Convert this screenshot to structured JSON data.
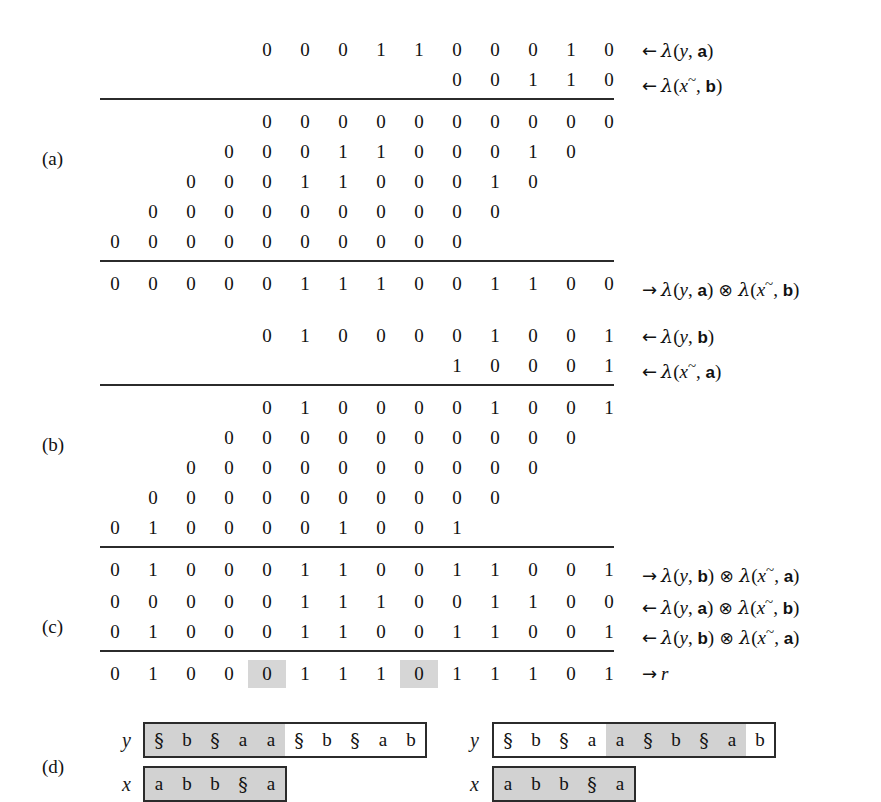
{
  "figure": {
    "caption_labels": [
      "(a)",
      "(b)",
      "(c)",
      "(d)"
    ],
    "columns": 14,
    "highlight_color": "#d6d6d6",
    "shade_color": "#d2d2d2",
    "rule_color": "#2b2b2b"
  },
  "section_a": {
    "label": "(a)",
    "operands": [
      {
        "digits": [
          "0",
          "0",
          "0",
          "1",
          "1",
          "0",
          "0",
          "0",
          "1",
          "0"
        ],
        "offset": 4,
        "label_arrow": "←",
        "label": "λ(y, a)",
        "label_parts": {
          "lambda": "λ",
          "open": "(",
          "var": "y",
          "comma": ", ",
          "sym": "a",
          "close": ")"
        }
      },
      {
        "digits": [
          "0",
          "0",
          "1",
          "1",
          "0"
        ],
        "offset": 9,
        "label_arrow": "←",
        "label": "λ(x~, b)",
        "label_parts": {
          "lambda": "λ",
          "open": "(",
          "var": "x",
          "tilde": "~",
          "comma": ", ",
          "sym": "b",
          "close": ")"
        }
      }
    ],
    "partials": [
      {
        "digits": [
          "0",
          "0",
          "0",
          "0",
          "0",
          "0",
          "0",
          "0",
          "0",
          "0"
        ],
        "offset": 4
      },
      {
        "digits": [
          "0",
          "0",
          "0",
          "1",
          "1",
          "0",
          "0",
          "0",
          "1",
          "0"
        ],
        "offset": 3
      },
      {
        "digits": [
          "0",
          "0",
          "0",
          "1",
          "1",
          "0",
          "0",
          "0",
          "1",
          "0"
        ],
        "offset": 2
      },
      {
        "digits": [
          "0",
          "0",
          "0",
          "0",
          "0",
          "0",
          "0",
          "0",
          "0",
          "0"
        ],
        "offset": 1
      },
      {
        "digits": [
          "0",
          "0",
          "0",
          "0",
          "0",
          "0",
          "0",
          "0",
          "0",
          "0"
        ],
        "offset": 0
      }
    ],
    "result": {
      "digits": [
        "0",
        "0",
        "0",
        "0",
        "0",
        "1",
        "1",
        "1",
        "0",
        "0",
        "1",
        "1",
        "0",
        "0"
      ],
      "offset": 0,
      "label_arrow": "→",
      "label": "λ(y, a) ⊗ λ(x~, b)"
    }
  },
  "section_b": {
    "label": "(b)",
    "operands": [
      {
        "digits": [
          "0",
          "1",
          "0",
          "0",
          "0",
          "0",
          "1",
          "0",
          "0",
          "1"
        ],
        "offset": 4,
        "label_arrow": "←",
        "label": "λ(y, b)"
      },
      {
        "digits": [
          "1",
          "0",
          "0",
          "0",
          "1"
        ],
        "offset": 9,
        "label_arrow": "←",
        "label": "λ(x~, a)"
      }
    ],
    "partials": [
      {
        "digits": [
          "0",
          "1",
          "0",
          "0",
          "0",
          "0",
          "1",
          "0",
          "0",
          "1"
        ],
        "offset": 4
      },
      {
        "digits": [
          "0",
          "0",
          "0",
          "0",
          "0",
          "0",
          "0",
          "0",
          "0",
          "0"
        ],
        "offset": 3
      },
      {
        "digits": [
          "0",
          "0",
          "0",
          "0",
          "0",
          "0",
          "0",
          "0",
          "0",
          "0"
        ],
        "offset": 2
      },
      {
        "digits": [
          "0",
          "0",
          "0",
          "0",
          "0",
          "0",
          "0",
          "0",
          "0",
          "0"
        ],
        "offset": 1
      },
      {
        "digits": [
          "0",
          "1",
          "0",
          "0",
          "0",
          "0",
          "1",
          "0",
          "0",
          "1"
        ],
        "offset": 0
      }
    ],
    "result": {
      "digits": [
        "0",
        "1",
        "0",
        "0",
        "0",
        "1",
        "1",
        "0",
        "0",
        "1",
        "1",
        "0",
        "0",
        "1"
      ],
      "offset": 0,
      "label_arrow": "→",
      "label": "λ(y, b) ⊗ λ(x~, a)"
    }
  },
  "section_c": {
    "label": "(c)",
    "operands": [
      {
        "digits": [
          "0",
          "0",
          "0",
          "0",
          "0",
          "1",
          "1",
          "1",
          "0",
          "0",
          "1",
          "1",
          "0",
          "0"
        ],
        "offset": 0,
        "label_arrow": "←",
        "label": "λ(y, a) ⊗ λ(x~, b)"
      },
      {
        "digits": [
          "0",
          "1",
          "0",
          "0",
          "0",
          "1",
          "1",
          "0",
          "0",
          "1",
          "1",
          "0",
          "0",
          "1"
        ],
        "offset": 0,
        "label_arrow": "←",
        "label": "λ(y, b) ⊗ λ(x~, a)"
      }
    ],
    "result": {
      "digits": [
        "0",
        "1",
        "0",
        "0",
        "0",
        "1",
        "1",
        "1",
        "0",
        "1",
        "1",
        "1",
        "0",
        "1"
      ],
      "highlighted_indices": [
        4,
        8
      ],
      "offset": 0,
      "label_arrow": "→",
      "label": "r"
    }
  },
  "section_d": {
    "label": "(d)",
    "left": {
      "y_var": "y",
      "y_chars": [
        "§",
        "b",
        "§",
        "a",
        "a",
        "§",
        "b",
        "§",
        "a",
        "b"
      ],
      "y_shaded": [
        0,
        1,
        2,
        3,
        4
      ],
      "x_var": "x",
      "x_chars": [
        "a",
        "b",
        "b",
        "§",
        "a"
      ],
      "x_shaded": [
        0,
        1,
        2,
        3,
        4
      ]
    },
    "right": {
      "y_var": "y",
      "y_chars": [
        "§",
        "b",
        "§",
        "a",
        "a",
        "§",
        "b",
        "§",
        "a",
        "b"
      ],
      "y_shaded": [
        4,
        5,
        6,
        7,
        8
      ],
      "x_var": "x",
      "x_chars": [
        "a",
        "b",
        "b",
        "§",
        "a"
      ],
      "x_shaded": [
        0,
        1,
        2,
        3,
        4
      ]
    }
  }
}
